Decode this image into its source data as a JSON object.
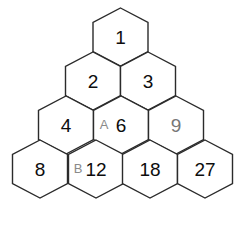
{
  "figure": {
    "kind": "hexagon-number-triangle",
    "background_color": "#ffffff",
    "stroke_color": "#2b2b2b",
    "dark_text_color": "#0d0d0d",
    "gray_text_color": "#777777",
    "label_text_color": "#8a8a8a"
  },
  "geometry": {
    "hex_width": 55,
    "hex_height": 58,
    "row_pitch": 44,
    "apex_x": 120,
    "apex_y": 8
  },
  "rows": [
    {
      "index": 1,
      "cells": [
        {
          "value": "1",
          "tone": "dark",
          "cx": 120.5,
          "cy": 37
        }
      ]
    },
    {
      "index": 2,
      "cells": [
        {
          "value": "2",
          "tone": "dark",
          "cx": 93,
          "cy": 81
        },
        {
          "value": "3",
          "tone": "dark",
          "cx": 148,
          "cy": 81
        }
      ]
    },
    {
      "index": 3,
      "cells": [
        {
          "value": "4",
          "tone": "dark",
          "cx": 66,
          "cy": 125
        },
        {
          "value": "6",
          "tone": "dark",
          "cx": 121,
          "cy": 125
        },
        {
          "value": "9",
          "tone": "gray",
          "cx": 176,
          "cy": 125
        }
      ]
    },
    {
      "index": 4,
      "cells": [
        {
          "value": "8",
          "tone": "dark",
          "cx": 40,
          "cy": 169
        },
        {
          "value": "12",
          "tone": "dark",
          "cx": 96,
          "cy": 169
        },
        {
          "value": "18",
          "tone": "dark",
          "cx": 150,
          "cy": 169
        },
        {
          "value": "27",
          "tone": "dark",
          "cx": 205,
          "cy": 169
        }
      ]
    }
  ],
  "vertex_labels": [
    {
      "text": "A",
      "x": 104,
      "y": 124
    },
    {
      "text": "B",
      "x": 78,
      "y": 168
    }
  ]
}
